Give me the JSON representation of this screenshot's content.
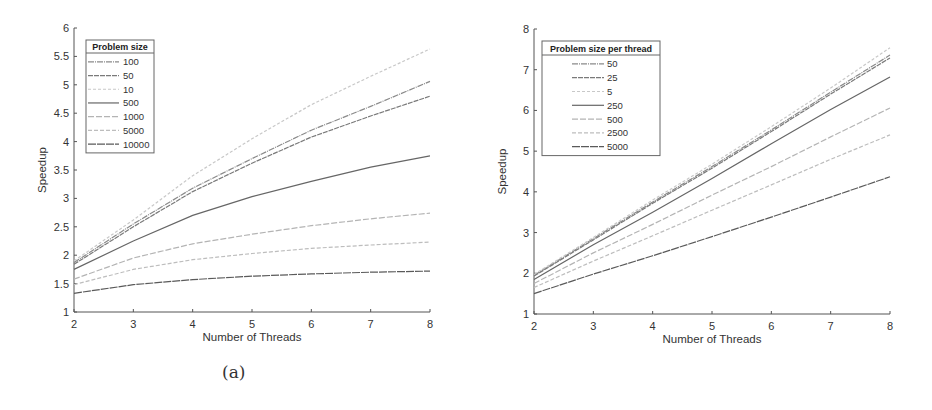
{
  "captions": {
    "a": "(a)",
    "b": "(b)"
  },
  "chart_data": [
    {
      "id": "a",
      "type": "line",
      "title": "",
      "xlabel": "Number of Threads",
      "ylabel": "Speedup",
      "xlim": [
        2,
        8
      ],
      "ylim": [
        1,
        6
      ],
      "xticks": [
        2,
        3,
        4,
        5,
        6,
        7,
        8
      ],
      "yticks": [
        1,
        1.5,
        2,
        2.5,
        3,
        3.5,
        4,
        4.5,
        5,
        5.5,
        6
      ],
      "ytick_labels": [
        "1",
        "1.5",
        "2",
        "2.5",
        "3",
        "3.5",
        "4",
        "4.5",
        "5",
        "5.5",
        "6"
      ],
      "grid": false,
      "legend": {
        "title": "Problem size",
        "position": "upper left"
      },
      "x": [
        2,
        3,
        4,
        5,
        6,
        7,
        8
      ],
      "series": [
        {
          "name": "100",
          "color": "#8a8a8a",
          "dash": "6,1,1,1",
          "values": [
            1.87,
            2.55,
            3.18,
            3.7,
            4.2,
            4.62,
            5.06
          ]
        },
        {
          "name": "50",
          "color": "#7a7a7a",
          "dash": "5,1",
          "values": [
            1.84,
            2.5,
            3.12,
            3.62,
            4.08,
            4.45,
            4.8
          ]
        },
        {
          "name": "10",
          "color": "#c8c8c8",
          "dash": "3,2",
          "values": [
            1.9,
            2.62,
            3.4,
            4.05,
            4.65,
            5.15,
            5.63
          ]
        },
        {
          "name": "500",
          "color": "#666666",
          "dash": "",
          "values": [
            1.75,
            2.25,
            2.7,
            3.03,
            3.3,
            3.55,
            3.75
          ]
        },
        {
          "name": "1000",
          "color": "#b4b4b4",
          "dash": "6,2",
          "values": [
            1.58,
            1.95,
            2.2,
            2.37,
            2.52,
            2.64,
            2.74
          ]
        },
        {
          "name": "5000",
          "color": "#bdbdbd",
          "dash": "4,2",
          "values": [
            1.48,
            1.75,
            1.92,
            2.03,
            2.12,
            2.18,
            2.23
          ]
        },
        {
          "name": "10000",
          "color": "#5a5a5a",
          "dash": "8,1",
          "values": [
            1.33,
            1.48,
            1.57,
            1.63,
            1.67,
            1.7,
            1.72
          ]
        }
      ]
    },
    {
      "id": "b",
      "type": "line",
      "title": "",
      "xlabel": "Number of Threads",
      "ylabel": "Speedup",
      "xlim": [
        2,
        8
      ],
      "ylim": [
        1,
        8
      ],
      "xticks": [
        2,
        3,
        4,
        5,
        6,
        7,
        8
      ],
      "yticks": [
        1,
        2,
        3,
        4,
        5,
        6,
        7,
        8
      ],
      "ytick_labels": [
        "1",
        "2",
        "3",
        "4",
        "5",
        "6",
        "7",
        "8"
      ],
      "grid": false,
      "legend": {
        "title": "Problem size per thread",
        "position": "upper left"
      },
      "x": [
        2,
        3,
        4,
        5,
        6,
        7,
        8
      ],
      "series": [
        {
          "name": "50",
          "color": "#8a8a8a",
          "dash": "6,1,1,1",
          "values": [
            1.95,
            2.85,
            3.75,
            4.62,
            5.52,
            6.45,
            7.36
          ]
        },
        {
          "name": "25",
          "color": "#7a7a7a",
          "dash": "5,1",
          "values": [
            1.93,
            2.82,
            3.72,
            4.58,
            5.48,
            6.4,
            7.29
          ]
        },
        {
          "name": "5",
          "color": "#c8c8c8",
          "dash": "3,2",
          "values": [
            1.97,
            2.88,
            3.8,
            4.68,
            5.6,
            6.55,
            7.54
          ]
        },
        {
          "name": "250",
          "color": "#666666",
          "dash": "",
          "values": [
            1.85,
            2.7,
            3.5,
            4.33,
            5.18,
            6.02,
            6.82
          ]
        },
        {
          "name": "500",
          "color": "#b4b4b4",
          "dash": "6,2",
          "values": [
            1.75,
            2.5,
            3.2,
            3.92,
            4.62,
            5.35,
            6.06
          ]
        },
        {
          "name": "2500",
          "color": "#bdbdbd",
          "dash": "4,2",
          "values": [
            1.65,
            2.3,
            2.92,
            3.55,
            4.17,
            4.8,
            5.4
          ]
        },
        {
          "name": "5000",
          "color": "#5a5a5a",
          "dash": "8,1",
          "values": [
            1.5,
            1.98,
            2.43,
            2.9,
            3.38,
            3.87,
            4.37
          ]
        }
      ]
    }
  ]
}
